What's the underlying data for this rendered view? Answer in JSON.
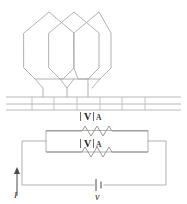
{
  "figure": {
    "canvas": {
      "width": 187,
      "height": 204
    },
    "background_color": "#ffffff",
    "line_color": "#a8a8a8"
  },
  "winding": {
    "name": "overlapping-hexagonal-coils",
    "coil_count": 3,
    "lead_count": 3,
    "description": "Three overlapping hexagon coil spans with downward leads into slotted core"
  },
  "core": {
    "name": "slotted-stator-core",
    "slot_count": 6,
    "divider_count": 5,
    "top_y": 97,
    "bottom_y": 110
  },
  "meters": {
    "voltmeter_label": "V",
    "ammeter_label": "A",
    "instances": [
      {
        "voltmeter_label": "V",
        "ammeter_label": "A",
        "row": "upper"
      },
      {
        "voltmeter_label": "V",
        "ammeter_label": "A",
        "row": "lower"
      }
    ]
  },
  "circuit": {
    "name": "equivalent-circuit",
    "source_label": "v",
    "current_label": "I",
    "branch_count": 2,
    "resistor_count": 2,
    "source_symbol": "battery-cell",
    "current_direction": "up"
  },
  "colors": {
    "wire": "#a8a8a8",
    "core": "#b0b0b0",
    "resistor": "#8c8c8c",
    "text": "#2b2b2b",
    "source": "#5a5a5a"
  }
}
